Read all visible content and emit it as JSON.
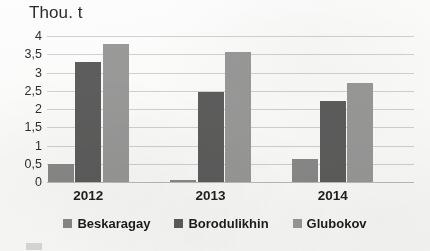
{
  "chart_data": {
    "type": "bar",
    "title": "Thou. t",
    "xlabel": "",
    "ylabel": "Thou. t",
    "categories": [
      "2012",
      "2013",
      "2014"
    ],
    "series": [
      {
        "name": "Beskaragay",
        "values": [
          0.48,
          0.06,
          0.62
        ],
        "color": "#8a8a8a"
      },
      {
        "name": "Borodulikhin",
        "values": [
          3.28,
          2.46,
          2.22
        ],
        "color": "#5e5e5e"
      },
      {
        "name": "Glubokov",
        "values": [
          3.78,
          3.55,
          2.71
        ],
        "color": "#9a9a9a"
      }
    ],
    "ylim": [
      0,
      4
    ],
    "ytick_step": 0.5,
    "ytick_labels": [
      "4",
      "3,5",
      "3",
      "2,5",
      "2",
      "1,5",
      "1",
      "0,5",
      "0"
    ],
    "ytick_values": [
      4,
      3.5,
      3,
      2.5,
      2,
      1.5,
      1,
      0.5,
      0
    ],
    "decimal_separator": ",",
    "grid": true,
    "grid_axis": "y",
    "legend_position": "bottom",
    "bar_orientation": "vertical",
    "grouped": true
  },
  "colors": {
    "background": "#fdfdfd",
    "gridline": "#d2d2d2",
    "axis": "#bdbdbd",
    "text": "#2b2b2b",
    "series_1": "#8a8a8a",
    "series_2": "#5e5e5e",
    "series_3": "#9a9a9a"
  }
}
